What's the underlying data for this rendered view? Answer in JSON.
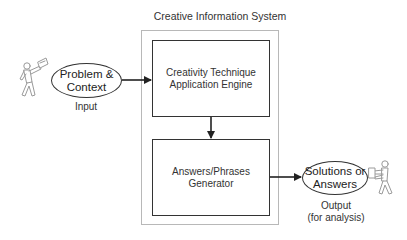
{
  "diagram": {
    "system_title": "Creative Information System",
    "nodes": {
      "engine": {
        "label_line1": "Creativity Technique",
        "label_line2": "Application Engine"
      },
      "generator": {
        "label_line1": "Answers/Phrases",
        "label_line2": "Generator"
      },
      "input_ellipse": {
        "label_line1": "Problem &",
        "label_line2": "Context"
      },
      "output_ellipse": {
        "label_line1": "Solutions or",
        "label_line2": "Answers"
      }
    },
    "labels": {
      "input": "Input",
      "output_line1": "Output",
      "output_line2": "(for analysis)"
    },
    "actors": {
      "left": {
        "icon": "person-holding-paper-icon",
        "role": "input-actor"
      },
      "right": {
        "icon": "person-holding-paper-icon",
        "role": "output-actor"
      }
    },
    "edges": [
      {
        "from": "input_ellipse",
        "to": "engine"
      },
      {
        "from": "engine",
        "to": "generator"
      },
      {
        "from": "generator",
        "to": "output_ellipse"
      }
    ],
    "colors": {
      "stroke": "#333333",
      "outer_border": "#b8b8b8",
      "actor_stroke": "#9a9a9a",
      "background": "#ffffff"
    }
  }
}
